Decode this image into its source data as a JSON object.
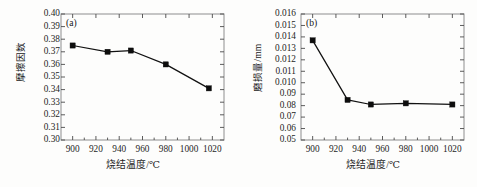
{
  "figure": {
    "panels": [
      {
        "tag": "(a)",
        "ylabel": "摩擦因数",
        "xlabel": "烧结温度/℃",
        "yticks": [
          "0.40",
          "0.39",
          "0.38",
          "0.37",
          "0.36",
          "0.35",
          "0.34",
          "0.33",
          "0.32",
          "0.31",
          "0.30"
        ],
        "xticks": [
          "900",
          "920",
          "940",
          "960",
          "980",
          "1000",
          "1020"
        ]
      },
      {
        "tag": "(b)",
        "ylabel": "磨损量/mm",
        "xlabel": "烧结温度/℃",
        "yticks": [
          "0.016",
          "0.015",
          "0.014",
          "0.013",
          "0.012",
          "0.011",
          "0.010",
          "0.09",
          "0.08",
          "0.07",
          "0.06",
          "0.05"
        ],
        "xticks": [
          "900",
          "920",
          "940",
          "960",
          "980",
          "1000",
          "1020"
        ]
      }
    ]
  },
  "chart_data": [
    {
      "type": "line",
      "title": "(a)",
      "xlabel": "烧结温度/℃",
      "ylabel": "摩擦因数",
      "x": [
        900,
        930,
        950,
        980,
        1017
      ],
      "values": [
        0.375,
        0.37,
        0.371,
        0.36,
        0.341
      ],
      "xlim": [
        890,
        1030
      ],
      "ylim": [
        0.3,
        0.4
      ],
      "ytick_values": [
        0.4,
        0.39,
        0.38,
        0.37,
        0.36,
        0.35,
        0.34,
        0.33,
        0.32,
        0.31,
        0.3
      ],
      "xtick_values": [
        900,
        920,
        940,
        960,
        980,
        1000,
        1020
      ],
      "grid": false,
      "legend": "none",
      "marker": "filled-square",
      "line_color": "#111111",
      "marker_color": "#0d0d0d"
    },
    {
      "type": "line",
      "title": "(b)",
      "xlabel": "烧结温度/℃",
      "ylabel": "磨损量/mm",
      "x": [
        900,
        930,
        950,
        980,
        1020
      ],
      "values": [
        0.0137,
        0.0085,
        0.0081,
        0.0082,
        0.0081
      ],
      "xlim": [
        890,
        1030
      ],
      "ylim": [
        0.005,
        0.016
      ],
      "ytick_values": [
        0.016,
        0.015,
        0.014,
        0.013,
        0.012,
        0.011,
        0.01,
        0.009,
        0.008,
        0.007,
        0.006,
        0.005
      ],
      "ytick_labels_as_printed": [
        "0.016",
        "0.015",
        "0.014",
        "0.013",
        "0.012",
        "0.011",
        "0.010",
        "0.09",
        "0.08",
        "0.07",
        "0.06",
        "0.05"
      ],
      "xtick_values": [
        900,
        920,
        940,
        960,
        980,
        1000,
        1020
      ],
      "grid": false,
      "legend": "none",
      "marker": "filled-square",
      "line_color": "#111111",
      "marker_color": "#0d0d0d"
    }
  ]
}
